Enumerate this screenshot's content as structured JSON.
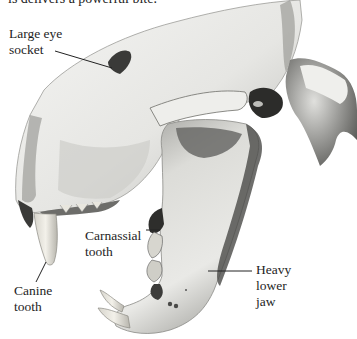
{
  "caption": {
    "partial_text": "is delivers a powerful bite."
  },
  "figure": {
    "colors": {
      "background": "#ffffff",
      "bone_light": "#f1f1ef",
      "bone_mid": "#c9c9c6",
      "bone_shadow": "#6f6f6c",
      "bone_dark": "#2a2a28",
      "leader_line": "#222222",
      "label_text": "#1e1e1e"
    }
  },
  "labels": {
    "eye_socket": {
      "lines": [
        "Large eye",
        "socket"
      ]
    },
    "carnassial": {
      "lines": [
        "Carnassial",
        "tooth"
      ]
    },
    "canine": {
      "lines": [
        "Canine",
        "tooth"
      ]
    },
    "lower_jaw": {
      "lines": [
        "Heavy",
        "lower",
        "jaw"
      ]
    }
  }
}
